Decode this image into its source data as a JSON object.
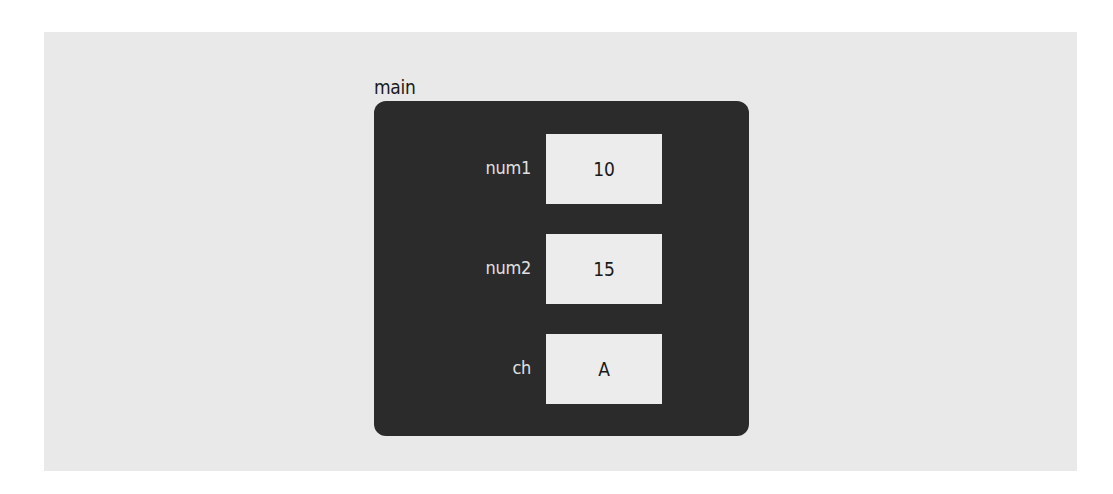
{
  "diagram": {
    "frame": {
      "name": "main"
    },
    "variables": [
      {
        "name": "num1",
        "value": "10"
      },
      {
        "name": "num2",
        "value": "15"
      },
      {
        "name": "ch",
        "value": "A"
      }
    ]
  },
  "colors": {
    "background": "#e9e9e9",
    "frame": "#2b2b2b",
    "cell": "#ececec",
    "label": "#e0e0e0"
  }
}
